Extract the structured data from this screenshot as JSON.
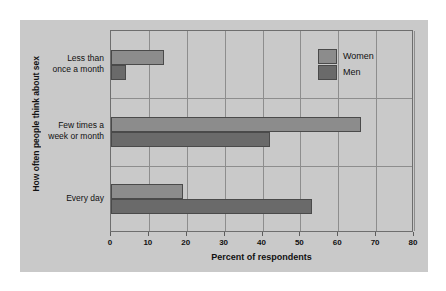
{
  "chart_data": {
    "type": "bar",
    "orientation": "horizontal",
    "title": "",
    "xlabel": "Percent of respondents",
    "ylabel": "How often people think about sex",
    "xlim": [
      0,
      80
    ],
    "xticks": [
      0,
      10,
      20,
      30,
      40,
      50,
      60,
      70,
      80
    ],
    "xtick_labels": [
      "0",
      "10",
      "20",
      "30",
      "40",
      "50",
      "60",
      "70",
      "80"
    ],
    "grid": true,
    "grid_axis": "both",
    "legend_position": "upper right",
    "categories": [
      "Less than once a month",
      "Few times a week or month",
      "Every day"
    ],
    "category_labels_multiline": [
      [
        "Less than",
        "once a month"
      ],
      [
        "Few times a",
        "week or month"
      ],
      [
        "Every day"
      ]
    ],
    "series": [
      {
        "name": "Women",
        "color": "#8c8c8c",
        "values": [
          14,
          66,
          19
        ]
      },
      {
        "name": "Men",
        "color": "#6a6a6a",
        "values": [
          4,
          42,
          53
        ]
      }
    ]
  },
  "legend": {
    "items": [
      {
        "label": "Women",
        "color": "#8c8c8c"
      },
      {
        "label": "Men",
        "color": "#6a6a6a"
      }
    ]
  },
  "colors": {
    "page_background": "#ffffff",
    "panel_background": "#c9c9c9",
    "axis_line": "#6e6e6e",
    "grid_line": "#8d8d8d",
    "text": "#111111",
    "women_bar": "#8c8c8c",
    "men_bar": "#6a6a6a"
  }
}
